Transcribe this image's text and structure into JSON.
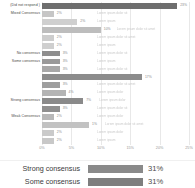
{
  "chart_data": {
    "type": "bar",
    "orientation": "horizontal",
    "title": "",
    "xlabel": "",
    "ylabel": "",
    "xlim": [
      0,
      25
    ],
    "grid": true,
    "legend_position": "below",
    "xticks": [
      "0%",
      "5%",
      "10%",
      "15%",
      "20%",
      "25%"
    ],
    "xtick_values": [
      0,
      5,
      10,
      15,
      20,
      25
    ],
    "categories": [
      "(Did not respond )",
      "Mixed Consensus",
      "",
      "",
      "",
      "",
      "No consensus",
      "Some consensus",
      "",
      "",
      "",
      "",
      "Strong consensus",
      "",
      "Weak Consensus",
      "",
      "",
      ""
    ],
    "values": [
      23,
      2,
      6,
      10,
      2,
      2,
      3,
      3,
      3,
      17,
      3,
      4,
      7,
      3,
      2,
      8,
      2,
      2
    ],
    "value_labels": [
      "23%",
      "2%",
      "2%",
      "10%",
      "2%",
      "2%",
      "3%",
      "3%",
      "3%",
      "17%",
      "3%",
      "4%",
      "7%",
      "3%",
      "2%",
      "1%",
      "2%",
      "2%"
    ],
    "bar_colors": [
      "#6e6e6e",
      "#c6c6c6",
      "#cfcfcf",
      "#bdbdbd",
      "#cdcdcd",
      "#cfcfcf",
      "#8e8e8e",
      "#9a9a9a",
      "#a8a8a8",
      "#8c8c8c",
      "#9e9e9e",
      "#b4b4b4",
      "#8a8a8a",
      "#8f8f8f",
      "#b8b8b8",
      "#c2c2c2",
      "#cacaca",
      "#c8c8c8"
    ],
    "row_notes": [
      "",
      "Lorem ipsum dolor sit",
      "Lorem ipsum",
      "Lorem ipsum dolor sit amet",
      "Lorem ipsum dolor sit amet",
      "Lorem ipsum",
      "Lorem ipsum dolor sit",
      "Lorem ipsum",
      "Lorem ipsum dolor sit",
      "",
      "Lorem ipsum dolor sit amet",
      "Lorem ipsum dolor",
      "Lorem ipsum dolor",
      "Lorem ipsum dolor sit",
      "Lorem ipsum dolor",
      "Lorem ipsum dolor sit amet",
      "Lorem ipsum dolor",
      "Lorem ipsum"
    ]
  },
  "legend": {
    "items": [
      {
        "label": "Strong consensus",
        "value": "31%",
        "color": "#8a8a8a",
        "width_pct": 100
      },
      {
        "label": "Some consensus",
        "value": "31%",
        "color": "#7e7e7e",
        "width_pct": 100
      }
    ]
  },
  "colors": {
    "gridline": "#e8e8e8",
    "axis_text": "#999999",
    "label_text": "#4a4a4a",
    "background": "#ffffff"
  }
}
